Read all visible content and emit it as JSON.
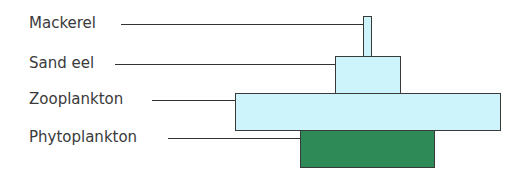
{
  "diagram": {
    "type": "pyramid of numbers",
    "levels": [
      {
        "label": "Mackerel",
        "label_x": 29,
        "label_y": 14,
        "line_x1": 121,
        "line_x2": 363,
        "line_y": 24,
        "box": {
          "x": 363,
          "y": 16,
          "w": 9,
          "h": 41
        },
        "color": "#cdf3fb"
      },
      {
        "label": "Sand eel",
        "label_x": 29,
        "label_y": 54,
        "line_x1": 115,
        "line_x2": 335,
        "line_y": 64,
        "box": {
          "x": 335,
          "y": 56,
          "w": 66,
          "h": 38
        },
        "color": "#cdf3fb"
      },
      {
        "label": "Zooplankton",
        "label_x": 29,
        "label_y": 90,
        "line_x1": 152,
        "line_x2": 235,
        "line_y": 100,
        "box": {
          "x": 235,
          "y": 93,
          "w": 266,
          "h": 38
        },
        "color": "#cdf3fb"
      },
      {
        "label": "Phytoplankton",
        "label_x": 29,
        "label_y": 128,
        "line_x1": 168,
        "line_x2": 300,
        "line_y": 138,
        "box": {
          "x": 300,
          "y": 130,
          "w": 135,
          "h": 38
        },
        "color": "#2e8b57"
      }
    ]
  }
}
